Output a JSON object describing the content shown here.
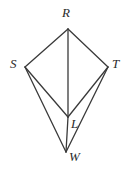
{
  "figure": {
    "background_color": "#ffffff",
    "stroke_color": "#3a3a3a",
    "label_color": "#2b2b2b",
    "stroke_width": 1.3,
    "canvas": {
      "width": 128,
      "height": 172
    },
    "vertices": [
      {
        "id": "R",
        "label": "R",
        "x": 68,
        "y": 29,
        "label_x": 62,
        "label_y": 6
      },
      {
        "id": "S",
        "label": "S",
        "x": 25,
        "y": 67,
        "label_x": 10,
        "label_y": 57
      },
      {
        "id": "T",
        "label": "T",
        "x": 108,
        "y": 67,
        "label_x": 112,
        "label_y": 57
      },
      {
        "id": "L",
        "label": "L",
        "x": 68,
        "y": 117,
        "label_x": 71,
        "label_y": 117
      },
      {
        "id": "W",
        "label": "W",
        "x": 66,
        "y": 152,
        "label_x": 69,
        "label_y": 150
      }
    ],
    "edges": [
      {
        "id": "RS",
        "from": "R",
        "to": "S",
        "name": "segment-r-s"
      },
      {
        "id": "RT",
        "from": "R",
        "to": "T",
        "name": "segment-r-t"
      },
      {
        "id": "SW",
        "from": "S",
        "to": "W",
        "name": "segment-s-w"
      },
      {
        "id": "TW",
        "from": "T",
        "to": "W",
        "name": "segment-t-w"
      },
      {
        "id": "RL",
        "from": "R",
        "to": "L",
        "name": "segment-r-l"
      },
      {
        "id": "SL",
        "from": "S",
        "to": "L",
        "name": "segment-s-l"
      },
      {
        "id": "TL",
        "from": "T",
        "to": "L",
        "name": "segment-t-l"
      },
      {
        "id": "LW",
        "from": "L",
        "to": "W",
        "name": "segment-l-w"
      }
    ]
  }
}
